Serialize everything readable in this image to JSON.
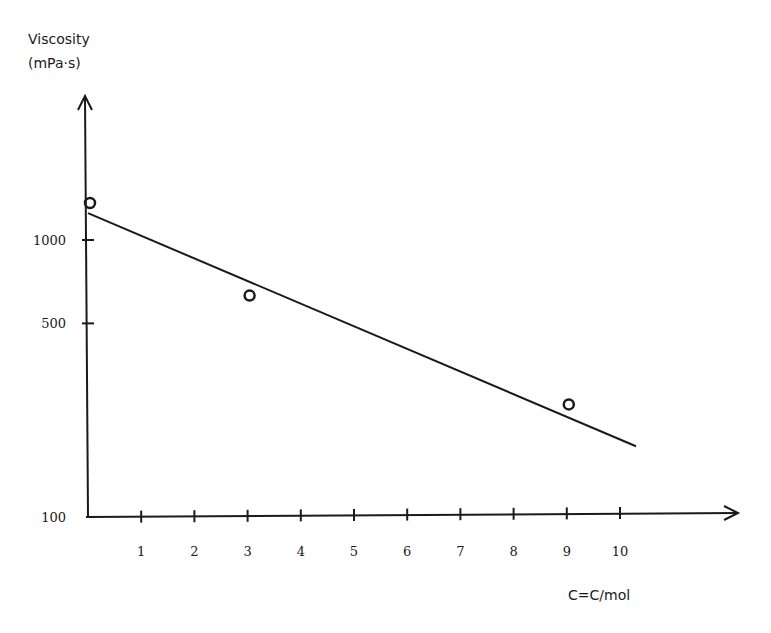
{
  "chart_data": {
    "type": "scatter",
    "title": "",
    "ylabel": "Viscosity",
    "ylabel_unit": "(mPa·s)",
    "xlabel": "C=C/mol",
    "yscale": "log",
    "ylim": [
      100,
      3000
    ],
    "xlim": [
      0,
      11.5
    ],
    "y_ticks": [
      {
        "value": 100,
        "label": "100"
      },
      {
        "value": 500,
        "label": "500"
      },
      {
        "value": 1000,
        "label": "1000"
      }
    ],
    "x_ticks": [
      {
        "value": 1,
        "label": "1"
      },
      {
        "value": 2,
        "label": "2"
      },
      {
        "value": 3,
        "label": "3"
      },
      {
        "value": 4,
        "label": "4"
      },
      {
        "value": 5,
        "label": "5"
      },
      {
        "value": 6,
        "label": "6"
      },
      {
        "value": 7,
        "label": "7"
      },
      {
        "value": 8,
        "label": "8"
      },
      {
        "value": 9,
        "label": "9"
      },
      {
        "value": 10,
        "label": "10"
      }
    ],
    "series": [
      {
        "name": "measured",
        "marker": "open-circle",
        "points": [
          {
            "x": 0,
            "y": 1360
          },
          {
            "x": 3,
            "y": 630
          },
          {
            "x": 9,
            "y": 255
          }
        ]
      }
    ],
    "fit_line": {
      "name": "trend",
      "from": {
        "x": 0,
        "y": 1250
      },
      "to": {
        "x": 10.3,
        "y": 180
      }
    },
    "grid": false,
    "legend": null
  }
}
